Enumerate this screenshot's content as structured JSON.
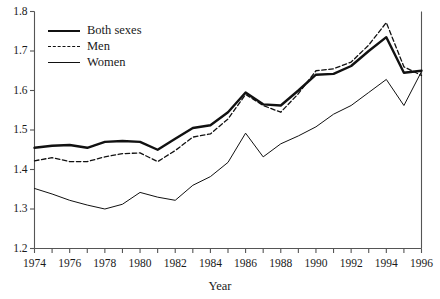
{
  "chart_data": {
    "type": "line",
    "title": "",
    "xlabel": "Year",
    "ylabel": "",
    "xlim": [
      1974,
      1996
    ],
    "ylim": [
      1.2,
      1.8
    ],
    "grid": false,
    "legend_position": "top-left",
    "x": [
      1974,
      1975,
      1976,
      1977,
      1978,
      1979,
      1980,
      1981,
      1982,
      1983,
      1984,
      1985,
      1986,
      1987,
      1988,
      1989,
      1990,
      1991,
      1992,
      1993,
      1994,
      1995,
      1996
    ],
    "xticks": [
      1974,
      1976,
      1978,
      1980,
      1982,
      1984,
      1986,
      1988,
      1990,
      1992,
      1994,
      1996
    ],
    "xtick_labels": [
      "1974",
      "1976",
      "1978",
      "1980",
      "1982",
      "1984",
      "1986",
      "1988",
      "1990",
      "1992",
      "1994",
      "1996"
    ],
    "xminor_step": 1,
    "yticks": [
      1.2,
      1.3,
      1.4,
      1.5,
      1.6,
      1.7,
      1.8
    ],
    "ytick_labels": [
      "1.2",
      "1.3",
      "1.4",
      "1.5",
      "1.6",
      "1.7",
      "1.8"
    ],
    "series": [
      {
        "name": "Both sexes",
        "style": "solid-thick",
        "color": "#111111",
        "width": 2.4,
        "values": [
          1.455,
          1.46,
          1.462,
          1.455,
          1.47,
          1.472,
          1.47,
          1.45,
          1.478,
          1.505,
          1.512,
          1.545,
          1.595,
          1.565,
          1.562,
          1.6,
          1.64,
          1.642,
          1.662,
          1.7,
          1.735,
          1.645,
          1.65
        ]
      },
      {
        "name": "Men",
        "style": "dashed",
        "color": "#111111",
        "width": 1.3,
        "values": [
          1.422,
          1.43,
          1.42,
          1.42,
          1.432,
          1.44,
          1.442,
          1.42,
          1.448,
          1.482,
          1.49,
          1.528,
          1.59,
          1.562,
          1.545,
          1.592,
          1.65,
          1.655,
          1.672,
          1.715,
          1.772,
          1.66,
          1.638
        ]
      },
      {
        "name": "Women",
        "style": "solid-thin",
        "color": "#111111",
        "width": 1.0,
        "values": [
          1.352,
          1.338,
          1.322,
          1.31,
          1.3,
          1.312,
          1.342,
          1.33,
          1.322,
          1.36,
          1.382,
          1.418,
          1.492,
          1.432,
          1.465,
          1.485,
          1.508,
          1.54,
          1.562,
          1.595,
          1.628,
          1.562,
          1.648
        ]
      }
    ]
  },
  "axes": {
    "x_title": "Year"
  },
  "legend": {
    "items": [
      {
        "label": "Both sexes",
        "swatch": "solid-thick"
      },
      {
        "label": "Men",
        "swatch": "dashed"
      },
      {
        "label": "Women",
        "swatch": "solid-thin"
      }
    ]
  }
}
